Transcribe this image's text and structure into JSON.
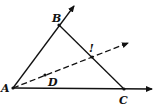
{
  "diagram": {
    "points": {
      "A": {
        "label": "A",
        "x": 13,
        "y": 88
      },
      "B": {
        "label": "B",
        "x": 59,
        "y": 25
      },
      "C": {
        "label": "C",
        "x": 124,
        "y": 89
      },
      "D": {
        "label": "D",
        "x": 45,
        "y": 75
      },
      "I": {
        "label": "!",
        "x": 92,
        "y": 57
      }
    },
    "rays": [
      {
        "name": "ray-AB",
        "from": "A",
        "through": "B",
        "style": "solid"
      },
      {
        "name": "ray-AC",
        "from": "A",
        "through": "C",
        "style": "solid"
      },
      {
        "name": "ray-AD",
        "from": "A",
        "through": "D",
        "style": "dashed"
      }
    ],
    "segments": [
      {
        "name": "segment-BC",
        "from": "B",
        "to": "C",
        "style": "solid"
      }
    ],
    "colors": {
      "stroke": "#111111",
      "background": "#ffffff"
    }
  }
}
